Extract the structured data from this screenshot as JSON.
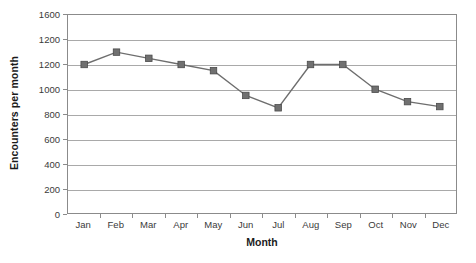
{
  "chart_data": {
    "type": "line",
    "title": "",
    "xlabel": "Month",
    "ylabel": "Encounters per month",
    "categories": [
      "Jan",
      "Feb",
      "Mar",
      "Apr",
      "May",
      "Jun",
      "Jul",
      "Aug",
      "Sep",
      "Oct",
      "Nov",
      "Dec"
    ],
    "values": [
      1200,
      1300,
      1250,
      1200,
      1150,
      950,
      850,
      1200,
      1200,
      1000,
      900,
      860
    ],
    "series": [
      {
        "name": "Encounters per month",
        "values": [
          1200,
          1300,
          1250,
          1200,
          1150,
          950,
          850,
          1200,
          1200,
          1000,
          900,
          860
        ]
      }
    ],
    "ylim": [
      0,
      1600
    ],
    "y_ticks": [
      0,
      200,
      400,
      600,
      800,
      1000,
      1200,
      1400,
      1600
    ],
    "y_tick_labels": [
      "0",
      "200",
      "400",
      "600",
      "800",
      "1000",
      "1200",
      "1200",
      "1600"
    ],
    "grid": true,
    "legend": false,
    "legend_position": "none",
    "marker": "square",
    "colors": {
      "series_line": "#6e6e6e",
      "marker_fill": "#707070",
      "marker_edge": "#4a4a4a",
      "gridline": "#a9a9a9",
      "axis": "#8b8b8b",
      "text": "#3a3a3a",
      "title_text": "#1b1b1b",
      "background": "#ffffff"
    }
  }
}
